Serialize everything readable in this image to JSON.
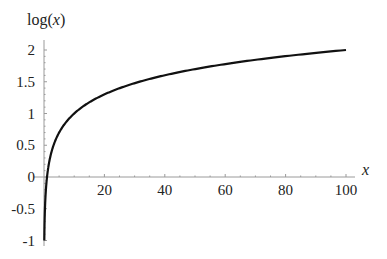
{
  "chart_data": {
    "type": "line",
    "title": "",
    "xlabel": "x",
    "ylabel": "log(x)",
    "function": "log10(x)",
    "xlim": [
      0,
      100
    ],
    "ylim": [
      -1,
      2
    ],
    "x_ticks": [
      20,
      40,
      60,
      80,
      100
    ],
    "x_tick_labels": [
      "20",
      "40",
      "60",
      "80",
      "100"
    ],
    "y_ticks": [
      -1,
      -0.5,
      0,
      0.5,
      1,
      1.5,
      2
    ],
    "y_tick_labels": [
      "-1",
      "-0.5",
      "0",
      "0.5",
      "1",
      "1.5",
      "2"
    ],
    "grid": false,
    "legend": null,
    "series": [
      {
        "name": "log(x)",
        "x": [
          0.1,
          0.2,
          0.5,
          1,
          2,
          3,
          5,
          7,
          10,
          15,
          20,
          30,
          40,
          50,
          60,
          70,
          80,
          90,
          100
        ],
        "values": [
          -1,
          -0.699,
          -0.301,
          0,
          0.301,
          0.477,
          0.699,
          0.845,
          1,
          1.176,
          1.301,
          1.477,
          1.602,
          1.699,
          1.778,
          1.845,
          1.903,
          1.954,
          2
        ]
      }
    ],
    "colors": {
      "curve": "#111111",
      "axis": "#999999"
    }
  }
}
